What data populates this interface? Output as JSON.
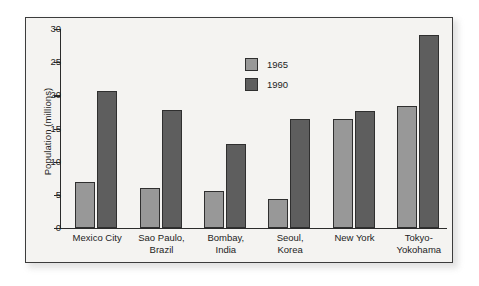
{
  "chart_data": {
    "type": "bar",
    "title": "",
    "xlabel": "",
    "ylabel": "Population (millions)",
    "ylim": [
      0,
      30
    ],
    "yticks": [
      0,
      5,
      10,
      15,
      20,
      25,
      30
    ],
    "ytick_labels": [
      "0",
      "5",
      "10",
      "15",
      "20",
      "25",
      "30"
    ],
    "grid": false,
    "legend_position": "upper center",
    "categories": [
      "Mexico City",
      "Sao Paulo, Brazil",
      "Bombay, India",
      "Seoul, Korea",
      "New York",
      "Tokyo-Yokohama"
    ],
    "category_lines": [
      [
        "Mexico City"
      ],
      [
        "Sao Paulo,",
        "Brazil"
      ],
      [
        "Bombay,",
        "India"
      ],
      [
        "Seoul,",
        "Korea"
      ],
      [
        "New York"
      ],
      [
        "Tokyo-",
        "Yokohama"
      ]
    ],
    "series": [
      {
        "name": "1965",
        "color": "#989898",
        "values": [
          6.9,
          6.0,
          5.6,
          4.4,
          16.5,
          18.4
        ]
      },
      {
        "name": "1990",
        "color": "#5e5e5e",
        "values": [
          20.6,
          17.8,
          12.7,
          16.5,
          17.6,
          29.1
        ]
      }
    ]
  },
  "legend": {
    "items": [
      {
        "label": "1965"
      },
      {
        "label": "1990"
      }
    ]
  },
  "colors": {
    "series_1965": "#989898",
    "series_1990": "#5e5e5e",
    "axis": "#2b2b2b",
    "frame": "#3c3c3c",
    "plot_background": "#f4f3f1",
    "page_background": "#ffffff"
  }
}
